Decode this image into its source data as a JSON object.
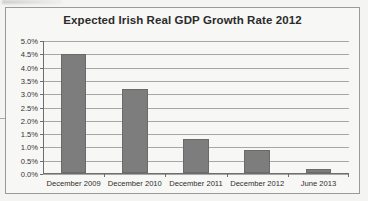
{
  "chart_data": {
    "type": "bar",
    "title": "Expected Irish Real GDP Growth Rate 2012",
    "xlabel": "",
    "ylabel": "",
    "categories": [
      "December 2009",
      "December 2010",
      "December 2011",
      "December 2012",
      "June 2013"
    ],
    "values": [
      4.5,
      3.2,
      1.3,
      0.9,
      0.2
    ],
    "value_suffix": "%",
    "ylim": [
      0.0,
      5.0
    ],
    "ytick_values": [
      5.0,
      4.5,
      4.0,
      3.5,
      3.0,
      2.5,
      2.0,
      1.5,
      1.0,
      0.5,
      0.0
    ],
    "ytick_labels": [
      "5.0%",
      "4.5%",
      "4.0%",
      "3.5%",
      "3.0%",
      "2.5%",
      "2.0%",
      "1.5%",
      "1.0%",
      "0.5%",
      "0.0%"
    ],
    "grid": true,
    "legend": false,
    "legend_position": "none",
    "series": [
      {
        "name": "Expected Irish Real GDP Growth Rate 2012",
        "values": [
          4.5,
          3.2,
          1.3,
          0.9,
          0.2
        ]
      }
    ],
    "colors": {
      "bar_fill": "#7d7d7d",
      "bar_border": "#6a6a6a",
      "gridline": "#a7a7a7",
      "axis": "#6e6e6e",
      "plot_background": "#f7f7f5",
      "frame_border": "#9a9a9a",
      "title_text": "#2b2b2b",
      "tick_text": "#333333"
    }
  }
}
